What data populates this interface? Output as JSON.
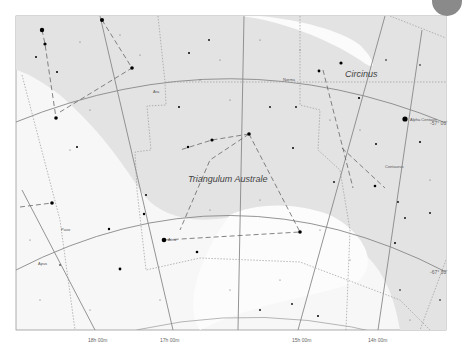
{
  "map": {
    "title": "Triangulum Australe star chart",
    "constellations": [
      {
        "name": "Triangulum Australe",
        "x": 188,
        "y": 182
      },
      {
        "name": "Circinus",
        "x": 345,
        "y": 77
      }
    ],
    "neighbor_labels": [
      {
        "name": "Pavo",
        "x": 61,
        "y": 231
      },
      {
        "name": "Apus",
        "x": 38,
        "y": 265
      },
      {
        "name": "Ara",
        "x": 153,
        "y": 93
      },
      {
        "name": "Centaurus",
        "x": 385,
        "y": 168
      },
      {
        "name": "Norma",
        "x": 283,
        "y": 81
      }
    ],
    "star_labels": [
      {
        "name": "Alpha Centauri",
        "x": 403,
        "y": 122
      },
      {
        "name": "Atria",
        "x": 168,
        "y": 240
      }
    ],
    "ra_labels": [
      {
        "text": "18h 00m",
        "x": 95,
        "y": 343
      },
      {
        "text": "17h 00m",
        "x": 166,
        "y": 343
      },
      {
        "text": "15h 00m",
        "x": 294,
        "y": 343
      },
      {
        "text": "14h 00m",
        "x": 370,
        "y": 343
      }
    ],
    "dec_labels": [
      {
        "text": "-57° 00'",
        "x": 434,
        "y": 125
      },
      {
        "text": "-67° 30'",
        "x": 432,
        "y": 273
      }
    ],
    "colors": {
      "milky_way": "#e6e6e6",
      "background": "#f6f6f6",
      "grid": "#888888",
      "stars": "#000000"
    }
  }
}
